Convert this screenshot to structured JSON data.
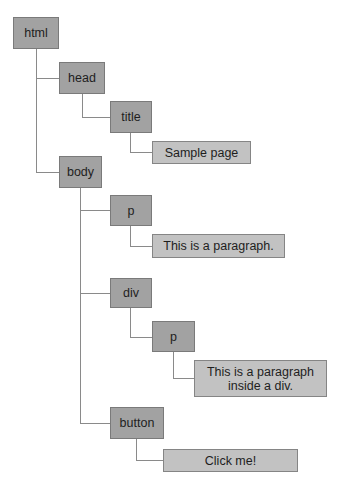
{
  "diagram": {
    "type": "dom-tree",
    "colors": {
      "element_fill": "#a2a2a2",
      "text_fill": "#c2c2c2",
      "border": "#7a7a7a",
      "connector": "#8a8a8a",
      "text": "#1e1e1e"
    },
    "nodes": {
      "html": {
        "label": "html",
        "kind": "element"
      },
      "head": {
        "label": "head",
        "kind": "element"
      },
      "title": {
        "label": "title",
        "kind": "element"
      },
      "title_text": {
        "label": "Sample page",
        "kind": "text"
      },
      "body": {
        "label": "body",
        "kind": "element"
      },
      "p1": {
        "label": "p",
        "kind": "element"
      },
      "p1_text": {
        "label": "This is a paragraph.",
        "kind": "text"
      },
      "div": {
        "label": "div",
        "kind": "element"
      },
      "p2": {
        "label": "p",
        "kind": "element"
      },
      "p2_text": {
        "label": "This is a paragraph inside a div.",
        "kind": "text"
      },
      "button": {
        "label": "button",
        "kind": "element"
      },
      "button_text": {
        "label": "Click me!",
        "kind": "text"
      }
    },
    "edges": [
      [
        "html",
        "head"
      ],
      [
        "head",
        "title"
      ],
      [
        "title",
        "title_text"
      ],
      [
        "html",
        "body"
      ],
      [
        "body",
        "p1"
      ],
      [
        "p1",
        "p1_text"
      ],
      [
        "body",
        "div"
      ],
      [
        "div",
        "p2"
      ],
      [
        "p2",
        "p2_text"
      ],
      [
        "body",
        "button"
      ],
      [
        "button",
        "button_text"
      ]
    ]
  }
}
